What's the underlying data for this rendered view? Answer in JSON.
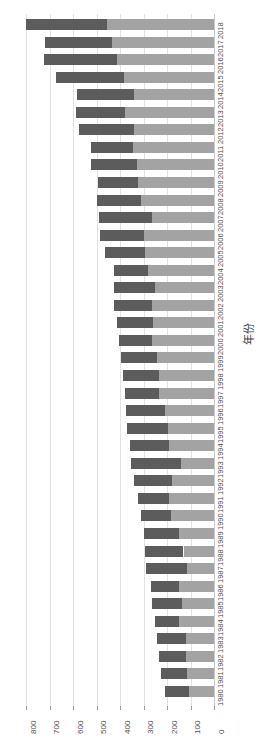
{
  "chart_data": {
    "type": "bar",
    "orientation": "horizontal-stacked-rotated",
    "title": "",
    "subtitle": "",
    "xlabel": "",
    "ylabel": "年份",
    "xlim": [
      0,
      800
    ],
    "x_axis_reversed": true,
    "grid": true,
    "legend": "none",
    "x_ticks": [
      800,
      700,
      600,
      500,
      400,
      300,
      200,
      100,
      0
    ],
    "categories": [
      "2018",
      "2017",
      "2016",
      "2015",
      "2014",
      "2013",
      "2012",
      "2011",
      "2010",
      "2009",
      "2008",
      "2007",
      "2006",
      "2005",
      "2004",
      "2003",
      "2002",
      "2001",
      "2000",
      "1999",
      "1998",
      "1997",
      "1996",
      "1995",
      "1994",
      "1993",
      "1992",
      "1991",
      "1990",
      "1989",
      "1988",
      "1987",
      "1986",
      "1985",
      "1984",
      "1983",
      "1982",
      "1981",
      "1980"
    ],
    "series": [
      {
        "name": "segment-dark",
        "color": "#5c5c5c",
        "values": [
          345,
          285,
          310,
          290,
          245,
          210,
          235,
          180,
          195,
          170,
          190,
          225,
          185,
          170,
          145,
          175,
          160,
          155,
          140,
          150,
          155,
          145,
          165,
          175,
          170,
          215,
          160,
          135,
          125,
          150,
          165,
          175,
          120,
          130,
          100,
          125,
          115,
          110,
          105
        ]
      },
      {
        "name": "segment-light",
        "color": "#a3a3a3",
        "values": [
          455,
          435,
          415,
          385,
          340,
          380,
          340,
          345,
          330,
          325,
          310,
          265,
          300,
          295,
          280,
          250,
          265,
          260,
          265,
          245,
          235,
          235,
          210,
          195,
          190,
          140,
          180,
          190,
          185,
          150,
          130,
          115,
          150,
          135,
          150,
          120,
          120,
          115,
          105
        ]
      }
    ],
    "totals": [
      800,
      720,
      725,
      675,
      585,
      590,
      575,
      525,
      525,
      495,
      500,
      490,
      485,
      465,
      425,
      425,
      425,
      415,
      405,
      395,
      390,
      380,
      375,
      370,
      360,
      355,
      340,
      325,
      310,
      300,
      295,
      290,
      270,
      265,
      250,
      245,
      235,
      225,
      210
    ]
  }
}
